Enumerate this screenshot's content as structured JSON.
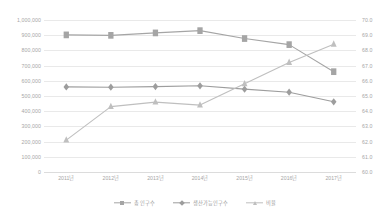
{
  "chart_data": {
    "type": "line",
    "title": "",
    "subtitle": "",
    "xlabel": "",
    "ylabel": "",
    "grid": true,
    "legend_position": "bottom",
    "categories": [
      "2011년",
      "2012년",
      "2013년",
      "2014년",
      "2015년",
      "2016년",
      "2017년"
    ],
    "axes": {
      "left": {
        "min": 0,
        "max": 1000000,
        "step": 100000,
        "ticks": [
          "1,000,000",
          "900,000",
          "800,000",
          "700,000",
          "600,000",
          "500,000",
          "400,000",
          "300,000",
          "200,000",
          "100,000",
          "0"
        ]
      },
      "right": {
        "min": 60.0,
        "max": 70.0,
        "step": 1.0,
        "ticks": [
          "70.0",
          "69.0",
          "68.0",
          "67.0",
          "66.0",
          "65.0",
          "64.0",
          "63.0",
          "62.0",
          "61.0",
          "60.0"
        ]
      }
    },
    "series": [
      {
        "name": "총 인구수",
        "axis": "left",
        "marker": "square",
        "color": "#a5a5a5",
        "values": [
          902000,
          899000,
          915000,
          930000,
          878000,
          838000,
          660000
        ]
      },
      {
        "name": "생산가능인구",
        "axis": "left",
        "marker": "diamond",
        "color": "#9d9d9d",
        "values": [
          560000,
          558000,
          562000,
          567000,
          545000,
          525000,
          462000
        ]
      },
      {
        "name": "비율",
        "axis": "right",
        "marker": "triangle",
        "color": "#bfbfbf",
        "values": [
          62.1,
          64.3,
          64.6,
          64.4,
          65.8,
          67.2,
          68.4
        ]
      }
    ]
  },
  "legend": {
    "items": [
      {
        "label": "총 인구수",
        "marker": "square",
        "color": "#a5a5a5"
      },
      {
        "label": "생산가능인구수",
        "marker": "diamond",
        "color": "#9d9d9d"
      },
      {
        "label": "비율",
        "marker": "triangle",
        "color": "#bfbfbf"
      }
    ]
  }
}
